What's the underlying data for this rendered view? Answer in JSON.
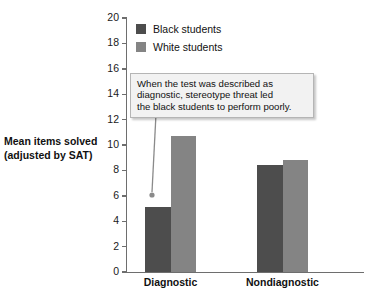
{
  "chart_data": {
    "type": "bar",
    "title": "",
    "subtitle": "",
    "xlabel": "",
    "ylabel": "Mean items solved (adjusted by SAT)",
    "ylabel_lines": [
      "Mean items solved",
      "(adjusted by SAT)"
    ],
    "categories": [
      "Diagnostic",
      "Nondiagnostic"
    ],
    "series": [
      {
        "name": "Black students",
        "color": "#4d4d4d",
        "values": [
          5.1,
          8.4
        ]
      },
      {
        "name": "White students",
        "color": "#848484",
        "values": [
          10.7,
          8.8
        ]
      }
    ],
    "ylim": [
      0,
      20
    ],
    "yticks": [
      0,
      2,
      4,
      6,
      8,
      10,
      12,
      14,
      16,
      18,
      20
    ],
    "ytick_labels": [
      "0",
      "2",
      "4",
      "6",
      "8",
      "10",
      "12",
      "14",
      "16",
      "18",
      "20"
    ],
    "grid": false,
    "legend_position": "top-left-inside",
    "annotations": [
      {
        "text": "When the test was described as diagnostic, stereotype threat led the black students to perform poorly.",
        "lines": [
          "When the test was described as",
          "diagnostic, stereotype threat led",
          "the black students to perform poorly."
        ],
        "points_to": {
          "category": "Diagnostic",
          "series": "Black students"
        }
      }
    ]
  },
  "legend": {
    "items": [
      {
        "label": "Black students",
        "color": "#4d4d4d"
      },
      {
        "label": "White students",
        "color": "#848484"
      }
    ]
  },
  "axis": {
    "y_title_line1": "Mean items solved",
    "y_title_line2": "(adjusted by SAT)",
    "ytick_labels": [
      "20",
      "18",
      "16",
      "14",
      "12",
      "10",
      "8",
      "6",
      "4",
      "2",
      "0"
    ],
    "x_labels": [
      "Diagnostic",
      "Nondiagnostic"
    ]
  },
  "callout": {
    "line1": "When the test was described as",
    "line2": "diagnostic, stereotype threat led",
    "line3": "the black students to perform poorly."
  },
  "colors": {
    "black_students": "#4d4d4d",
    "white_students": "#848484",
    "axis": "#6e6e6e",
    "callout_bg": "#f2f2f2",
    "callout_border": "#b5b5b5",
    "background": "#ffffff"
  }
}
